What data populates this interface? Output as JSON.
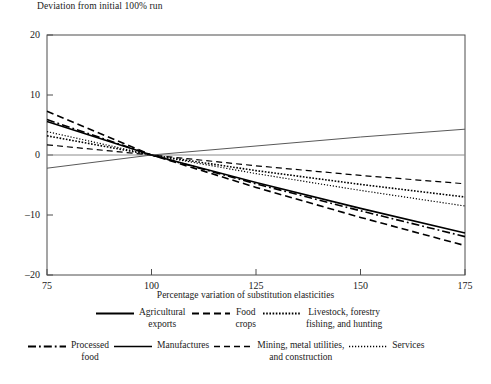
{
  "chart_data": {
    "type": "line",
    "title": "Deviation from initial 100% run",
    "xlabel": "Percentage variation of substitution elasticities",
    "ylabel": "",
    "xlim": [
      75,
      175
    ],
    "ylim": [
      -20,
      20
    ],
    "xticks": [
      75,
      100,
      125,
      150,
      175
    ],
    "yticks": [
      20,
      10,
      0,
      -10,
      -20
    ],
    "grid": false,
    "zero_line": true,
    "legend_position": "below-plot",
    "x": [
      75,
      100,
      125,
      150,
      175
    ],
    "series": [
      {
        "name": "Agricultural exports",
        "style": "solid",
        "color": "#000000",
        "width": 1.6,
        "values": [
          5.6,
          0.0,
          -4.6,
          -8.9,
          -13.0
        ]
      },
      {
        "name": "Food crops",
        "style": "dashed",
        "color": "#000000",
        "width": 1.6,
        "values": [
          7.3,
          0.0,
          -5.4,
          -10.4,
          -15.1
        ]
      },
      {
        "name": "Livestock, forestry fishing, and hunting",
        "style": "dotted",
        "color": "#000000",
        "width": 1.6,
        "values": [
          3.2,
          0.0,
          -2.6,
          -4.9,
          -7.0
        ]
      },
      {
        "name": "Processed food",
        "style": "dash-dot",
        "color": "#000000",
        "width": 1.6,
        "values": [
          5.9,
          0.0,
          -4.8,
          -9.3,
          -13.6
        ]
      },
      {
        "name": "Manufactures",
        "style": "solid-thin",
        "color": "#595959",
        "width": 1.0,
        "values": [
          -2.2,
          0.0,
          1.5,
          3.0,
          4.3
        ]
      },
      {
        "name": "Mining, metal utilities, and construction",
        "style": "dashed-thin",
        "color": "#000000",
        "width": 1.2,
        "values": [
          1.7,
          0.0,
          -1.8,
          -3.4,
          -4.8
        ]
      },
      {
        "name": "Services",
        "style": "dotted-fine",
        "color": "#000000",
        "width": 1.2,
        "values": [
          3.9,
          0.0,
          -3.1,
          -5.9,
          -8.5
        ]
      }
    ]
  },
  "chart": {
    "title": "Deviation from initial 100% run",
    "xaxis_label": "Percentage variation of substitution elasticities",
    "yticks": [
      {
        "label": "20"
      },
      {
        "label": "10"
      },
      {
        "label": "0"
      },
      {
        "label": "–10"
      },
      {
        "label": "–20"
      }
    ],
    "xticks": [
      {
        "label": "75"
      },
      {
        "label": "100"
      },
      {
        "label": "125"
      },
      {
        "label": "150"
      },
      {
        "label": "175"
      }
    ]
  },
  "legend": {
    "row1": [
      {
        "label": "Agricultural\nexports",
        "icon": "solid-line-icon"
      },
      {
        "label": "Food\ncrops",
        "icon": "dashed-line-icon"
      },
      {
        "label": "Livestock, forestry\nfishing, and hunting",
        "icon": "dotted-line-icon"
      }
    ],
    "row2": [
      {
        "label": "Processed\nfood",
        "icon": "dash-dot-line-icon"
      },
      {
        "label": "Manufactures",
        "icon": "solid-thin-line-icon"
      },
      {
        "label": "Mining, metal utilities,\nand construction",
        "icon": "dashed-thin-line-icon"
      },
      {
        "label": "Services",
        "icon": "dotted-fine-line-icon"
      }
    ]
  },
  "colors": {
    "axis": "#4d4d4d",
    "series_primary": "#000000",
    "manufactures": "#595959",
    "zero_line": "#8c8c8c",
    "background": "#ffffff"
  }
}
